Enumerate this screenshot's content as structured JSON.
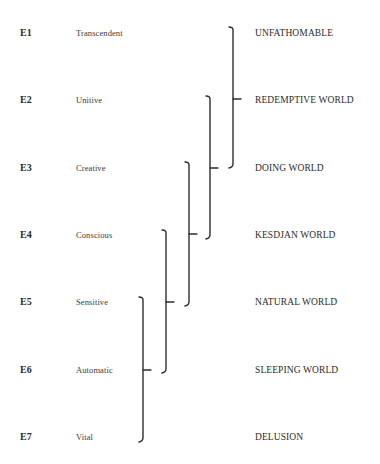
{
  "diagram": {
    "rows": [
      {
        "code": "E1",
        "energy": "Transcendent",
        "world": "UNFATHOMABLE"
      },
      {
        "code": "E2",
        "energy": "Unitive",
        "world": "REDEMPTIVE WORLD"
      },
      {
        "code": "E3",
        "energy": "Creative",
        "world": "DOING WORLD"
      },
      {
        "code": "E4",
        "energy": "Conscious",
        "world": "KESDJAN WORLD"
      },
      {
        "code": "E5",
        "energy": "Sensitive",
        "world": "NATURAL WORLD"
      },
      {
        "code": "E6",
        "energy": "Automatic",
        "world": "SLEEPING WORLD"
      },
      {
        "code": "E7",
        "energy": "Vital",
        "world": "DELUSION"
      }
    ],
    "brackets": [
      {
        "spans": [
          "E1",
          "E3"
        ],
        "points_to": "REDEMPTIVE WORLD"
      },
      {
        "spans": [
          "E2",
          "E4"
        ],
        "points_to": "DOING WORLD"
      },
      {
        "spans": [
          "E3",
          "E5"
        ],
        "points_to": "KESDJAN WORLD"
      },
      {
        "spans": [
          "E4",
          "E6"
        ],
        "points_to": "NATURAL WORLD"
      },
      {
        "spans": [
          "E5",
          "E7"
        ],
        "points_to": "SLEEPING WORLD"
      }
    ],
    "line_color": "#2e2e2e"
  }
}
